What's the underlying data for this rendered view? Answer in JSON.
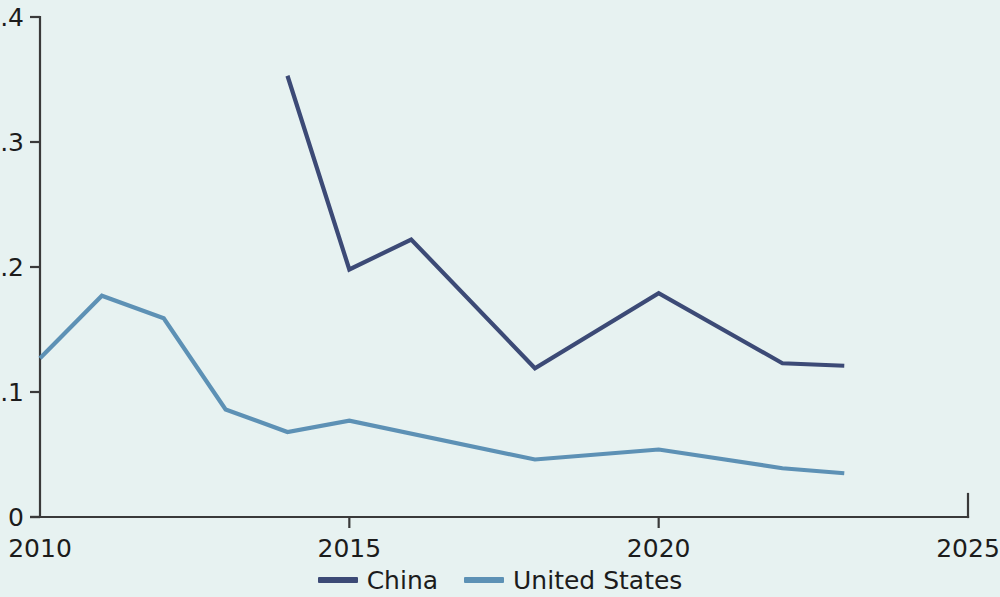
{
  "chart_data": {
    "type": "line",
    "title": "",
    "subtitle": "",
    "xlabel": "",
    "ylabel": "",
    "xlim": [
      2010,
      2025
    ],
    "ylim": [
      0,
      0.4
    ],
    "grid": false,
    "legend_position": "bottom-center",
    "background_color": "#e7f2f1",
    "x_tick_labels": [
      "2010",
      "2015",
      "2020",
      "2025"
    ],
    "x_ticks": [
      2010,
      2015,
      2020,
      2025
    ],
    "y_tick_labels": [
      "0",
      "0.1",
      "0.2",
      "0.3",
      "0.4"
    ],
    "y_ticks": [
      0,
      0.1,
      0.2,
      0.3,
      0.4
    ],
    "series": [
      {
        "name": "China",
        "color": "#3c4a76",
        "x": [
          2014,
          2015,
          2016,
          2018,
          2020,
          2022,
          2023
        ],
        "values": [
          0.353,
          0.198,
          0.222,
          0.119,
          0.179,
          0.123,
          0.121
        ]
      },
      {
        "name": "United States",
        "color": "#5d91b5",
        "x": [
          2010,
          2011,
          2012,
          2013,
          2014,
          2015,
          2018,
          2020,
          2022,
          2023
        ],
        "values": [
          0.127,
          0.177,
          0.159,
          0.086,
          0.068,
          0.077,
          0.046,
          0.054,
          0.039,
          0.035
        ]
      }
    ]
  },
  "legend": {
    "items": [
      {
        "label": "China",
        "color": "#3c4a76"
      },
      {
        "label": "United States",
        "color": "#5d91b5"
      }
    ]
  }
}
